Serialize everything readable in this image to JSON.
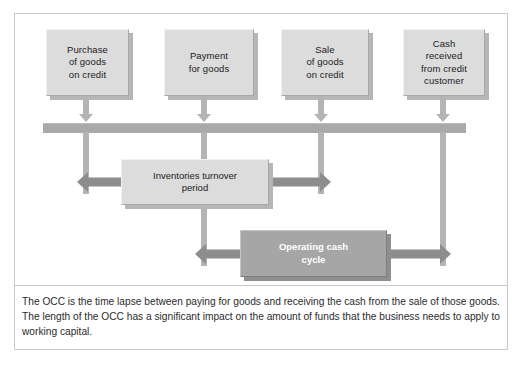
{
  "figure": {
    "type": "operating-cash-cycle-diagram",
    "colors": {
      "frame_border": "#c9c9c9",
      "box_fill_light": "#dcdcdc",
      "box_fill_dark": "#a6a6a6",
      "connector": "#b4b4b4",
      "timeline_bar": "#a9a9a9",
      "arrow": "#8d8d8d",
      "text_dark": "#1b1b1b",
      "text_light": "#ffffff"
    }
  },
  "diagram": {
    "event_boxes": [
      {
        "id": "purchase-of-goods-on-credit",
        "label": "Purchase\nof goods\non credit"
      },
      {
        "id": "payment-for-goods",
        "label": "Payment\nfor goods"
      },
      {
        "id": "sale-of-goods-on-credit",
        "label": "Sale\nof goods\non credit"
      },
      {
        "id": "cash-received-from-credit-customer",
        "label": "Cash\nreceived\nfrom credit\ncustomer"
      }
    ],
    "period_boxes": [
      {
        "id": "inventories-turnover-period",
        "label": "Inventories turnover\nperiod",
        "style": "light"
      },
      {
        "id": "operating-cash-cycle",
        "label": "Operating cash\ncycle",
        "style": "dark"
      }
    ]
  },
  "caption": {
    "text": "The OCC is the time lapse between paying for goods and receiving the cash from the sale of those goods. The length of the OCC has a significant impact on the amount of funds that the business needs to apply to working capital."
  }
}
